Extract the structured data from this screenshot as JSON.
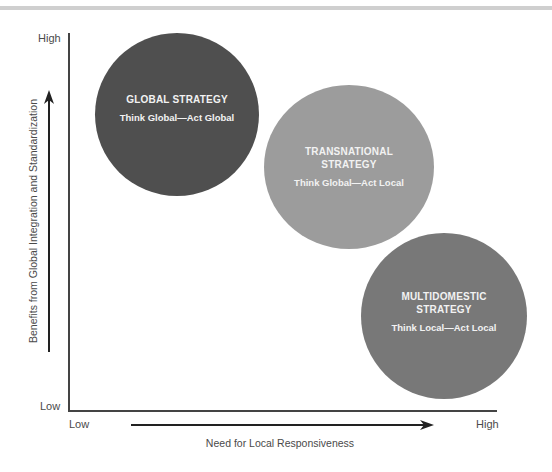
{
  "diagram": {
    "type": "strategy-matrix",
    "y_axis": {
      "title": "Benefits from Global Integration and Standardization",
      "high_label": "High",
      "low_label": "Low"
    },
    "x_axis": {
      "title": "Need for Local Responsiveness",
      "low_label": "Low",
      "high_label": "High"
    },
    "strategies": [
      {
        "name": "GLOBAL STRATEGY",
        "motto": "Think Global—Act Global",
        "color": "#4f4f4f",
        "position": "high integration, low responsiveness"
      },
      {
        "name": "TRANSNATIONAL STRATEGY",
        "motto": "Think Global—Act Local",
        "color": "#9c9c9c",
        "position": "high integration, high responsiveness (middle)"
      },
      {
        "name": "MULTIDOMESTIC STRATEGY",
        "motto": "Think Local—Act Local",
        "color": "#787878",
        "position": "low integration, high responsiveness"
      }
    ]
  },
  "colors": {
    "axis": "#444444",
    "text": "#4a4a4a",
    "circle_text": "#f2f2f2",
    "top_rule": "#cfcfcf"
  }
}
